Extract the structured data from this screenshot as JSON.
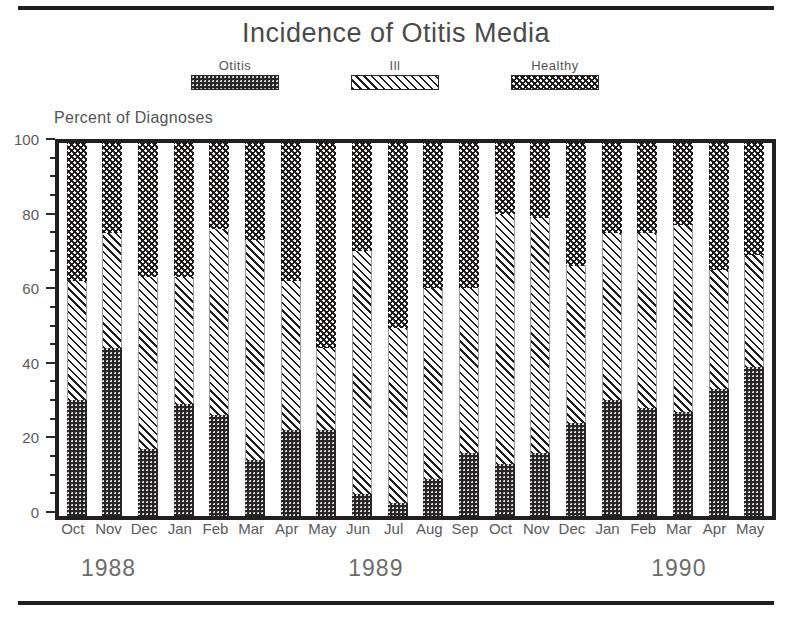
{
  "chart_data": {
    "type": "bar",
    "subtype": "stacked-percentage",
    "title": "Incidence of Otitis Media",
    "xlabel": "",
    "ylabel": "Percent of Diagnoses",
    "ylim": [
      0,
      100
    ],
    "ytick_major": [
      0,
      20,
      40,
      60,
      80,
      100
    ],
    "ytick_minor_step": 5,
    "grid": false,
    "legend_position": "top-center",
    "legend": [
      "Otitis",
      "Ill",
      "Healthy"
    ],
    "categories": [
      "Oct",
      "Nov",
      "Dec",
      "Jan",
      "Feb",
      "Mar",
      "Apr",
      "May",
      "Jun",
      "Jul",
      "Aug",
      "Sep",
      "Oct",
      "Nov",
      "Dec",
      "Jan",
      "Feb",
      "Mar",
      "Apr",
      "May"
    ],
    "years": [
      {
        "label": "1988",
        "start_index": 0,
        "end_index": 2
      },
      {
        "label": "1989",
        "start_index": 3,
        "end_index": 14
      },
      {
        "label": "1990",
        "start_index": 15,
        "end_index": 19
      }
    ],
    "series": [
      {
        "name": "Otitis",
        "fill": "otitis",
        "values": [
          31,
          45,
          18,
          30,
          27,
          15,
          23,
          23,
          6,
          3.5,
          10,
          17,
          14,
          17,
          25,
          31,
          29,
          28,
          34,
          40
        ]
      },
      {
        "name": "Ill",
        "fill": "ill",
        "values": [
          32,
          31,
          46,
          34,
          50,
          59,
          40,
          22,
          65,
          47,
          51,
          44,
          67,
          63,
          42,
          45,
          47,
          50,
          32,
          30
        ]
      },
      {
        "name": "Healthy",
        "fill": "healthy",
        "values": [
          37,
          24,
          36,
          36,
          23,
          26,
          37,
          55,
          29,
          49.5,
          39,
          39,
          19,
          20,
          33,
          24,
          24,
          22,
          34,
          30
        ]
      }
    ],
    "cumulative_tops": {
      "otitis": [
        31,
        45,
        18,
        30,
        27,
        15,
        23,
        23,
        6,
        3.5,
        10,
        17,
        14,
        17,
        25,
        31,
        29,
        28,
        34,
        40
      ],
      "ill": [
        63,
        76,
        64,
        64,
        77,
        74,
        63,
        45,
        71,
        50.5,
        61,
        61,
        81,
        80,
        67,
        76,
        76,
        78,
        66,
        70
      ],
      "healthy": [
        100,
        100,
        100,
        100,
        100,
        100,
        100,
        100,
        100,
        100,
        100,
        100,
        100,
        100,
        100,
        100,
        100,
        100,
        100,
        100
      ]
    },
    "colors": {
      "otitis": "#272425",
      "ill": "#ffffff",
      "healthy": "#1b1818",
      "axis": "#231f20",
      "text": "#5a5a5a"
    }
  }
}
